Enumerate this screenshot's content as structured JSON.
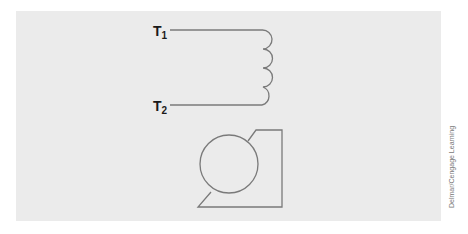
{
  "figure": {
    "terminals": [
      {
        "label": "T",
        "subscript": "1"
      },
      {
        "label": "T",
        "subscript": "2"
      }
    ],
    "coil_loops": 4,
    "credit": "Delmar/Cengage Learning",
    "colors": {
      "panel_background": "#ebebeb",
      "line": "#7a7a7a",
      "label": "#1a1a1a",
      "credit_text": "#777777"
    }
  }
}
